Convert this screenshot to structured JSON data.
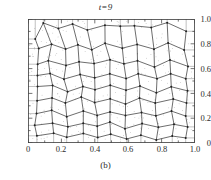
{
  "figure": {
    "title": "t=9",
    "caption": "(b)",
    "panel_label": "(b)",
    "frame_color": "#3a3a3a",
    "mesh_color": "#3c3c3c",
    "node_color": "#202020",
    "dot_color": "#6b6b6b",
    "background": "#ffffff"
  },
  "chart_data": {
    "type": "scatter",
    "title": "t=9",
    "subtitle": "(b)",
    "xlabel": "",
    "ylabel": "",
    "xlim": [
      0,
      1.0
    ],
    "ylim": [
      0,
      1.0
    ],
    "grid": false,
    "legend": null,
    "x_ticks": [
      0,
      0.2,
      0.4,
      0.6,
      0.8,
      1.0
    ],
    "x_tick_labels": [
      "0",
      "0.2",
      "0.4",
      "0.6",
      "0.8",
      "1.0"
    ],
    "y_ticks": [
      0,
      0.2,
      0.4,
      0.6,
      0.8,
      1.0
    ],
    "y_tick_labels": [
      "0",
      "0.2",
      "0.4",
      "0.6",
      "0.8",
      "1.0"
    ],
    "x_minor_ticks": [
      0.1,
      0.3,
      0.5,
      0.7,
      0.9
    ],
    "y_minor_ticks": [
      0.1,
      0.3,
      0.5,
      0.7,
      0.9
    ],
    "tick_direction": "in",
    "mesh": {
      "rows": 9,
      "cols": 10,
      "node_count": 100,
      "nodes": [
        [
          [
            0.04,
            0.835
          ],
          [
            0.1,
            0.96
          ],
          [
            0.18,
            0.93
          ],
          [
            0.275,
            0.955
          ],
          [
            0.36,
            0.905
          ],
          [
            0.45,
            0.96
          ],
          [
            0.545,
            0.945
          ],
          [
            0.64,
            0.95
          ],
          [
            0.74,
            0.93
          ],
          [
            0.83,
            0.965
          ],
          [
            0.94,
            0.905
          ]
        ],
        [
          [
            0.06,
            0.76
          ],
          [
            0.14,
            0.79
          ],
          [
            0.215,
            0.755
          ],
          [
            0.3,
            0.8
          ],
          [
            0.385,
            0.745
          ],
          [
            0.47,
            0.8
          ],
          [
            0.56,
            0.765
          ],
          [
            0.65,
            0.795
          ],
          [
            0.745,
            0.76
          ],
          [
            0.845,
            0.8
          ],
          [
            0.945,
            0.745
          ]
        ],
        [
          [
            0.055,
            0.64
          ],
          [
            0.13,
            0.66
          ],
          [
            0.22,
            0.625
          ],
          [
            0.31,
            0.665
          ],
          [
            0.4,
            0.635
          ],
          [
            0.49,
            0.67
          ],
          [
            0.58,
            0.63
          ],
          [
            0.665,
            0.665
          ],
          [
            0.76,
            0.62
          ],
          [
            0.855,
            0.66
          ],
          [
            0.95,
            0.625
          ]
        ],
        [
          [
            0.05,
            0.545
          ],
          [
            0.135,
            0.565
          ],
          [
            0.225,
            0.52
          ],
          [
            0.315,
            0.56
          ],
          [
            0.405,
            0.525
          ],
          [
            0.495,
            0.565
          ],
          [
            0.585,
            0.52
          ],
          [
            0.67,
            0.56
          ],
          [
            0.765,
            0.515
          ],
          [
            0.86,
            0.555
          ],
          [
            0.945,
            0.52
          ]
        ],
        [
          [
            0.055,
            0.445
          ],
          [
            0.14,
            0.465
          ],
          [
            0.23,
            0.42
          ],
          [
            0.32,
            0.46
          ],
          [
            0.41,
            0.425
          ],
          [
            0.5,
            0.46
          ],
          [
            0.59,
            0.42
          ],
          [
            0.675,
            0.455
          ],
          [
            0.77,
            0.415
          ],
          [
            0.865,
            0.45
          ],
          [
            0.95,
            0.42
          ]
        ],
        [
          [
            0.05,
            0.345
          ],
          [
            0.135,
            0.365
          ],
          [
            0.228,
            0.32
          ],
          [
            0.318,
            0.36
          ],
          [
            0.408,
            0.325
          ],
          [
            0.498,
            0.36
          ],
          [
            0.588,
            0.32
          ],
          [
            0.672,
            0.355
          ],
          [
            0.768,
            0.315
          ],
          [
            0.862,
            0.35
          ],
          [
            0.948,
            0.32
          ]
        ],
        [
          [
            0.055,
            0.245
          ],
          [
            0.14,
            0.265
          ],
          [
            0.232,
            0.22
          ],
          [
            0.322,
            0.26
          ],
          [
            0.412,
            0.225
          ],
          [
            0.502,
            0.26
          ],
          [
            0.592,
            0.22
          ],
          [
            0.676,
            0.255
          ],
          [
            0.772,
            0.215
          ],
          [
            0.866,
            0.25
          ],
          [
            0.952,
            0.22
          ]
        ],
        [
          [
            0.05,
            0.15
          ],
          [
            0.138,
            0.17
          ],
          [
            0.23,
            0.125
          ],
          [
            0.32,
            0.165
          ],
          [
            0.41,
            0.13
          ],
          [
            0.5,
            0.165
          ],
          [
            0.59,
            0.125
          ],
          [
            0.674,
            0.16
          ],
          [
            0.77,
            0.12
          ],
          [
            0.864,
            0.155
          ],
          [
            0.95,
            0.125
          ]
        ],
        [
          [
            0.06,
            0.055
          ],
          [
            0.145,
            0.075
          ],
          [
            0.235,
            0.04
          ],
          [
            0.325,
            0.07
          ],
          [
            0.415,
            0.035
          ],
          [
            0.505,
            0.07
          ],
          [
            0.595,
            0.035
          ],
          [
            0.68,
            0.065
          ],
          [
            0.775,
            0.03
          ],
          [
            0.868,
            0.06
          ],
          [
            0.945,
            0.04
          ]
        ]
      ]
    },
    "scatter_points_count": 260,
    "scatter_marker": "dot"
  }
}
